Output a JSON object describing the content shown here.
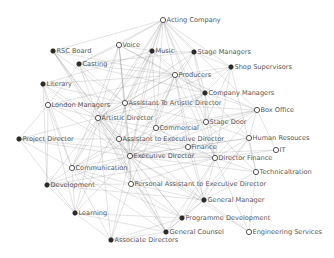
{
  "diagram": {
    "type": "network-graph",
    "nodes": [
      {
        "id": "acting-company",
        "label": "Acting Company",
        "x": 163,
        "y": 20,
        "style": "hollow"
      },
      {
        "id": "voice",
        "label": "Voice",
        "x": 119,
        "y": 45,
        "style": "hollow"
      },
      {
        "id": "music",
        "label": "Music",
        "x": 152,
        "y": 51,
        "style": "filled"
      },
      {
        "id": "stage-managers",
        "label": "Stage Managers",
        "x": 194,
        "y": 52,
        "style": "filled"
      },
      {
        "id": "rsc-board",
        "label": "RSC Board",
        "x": 53,
        "y": 51,
        "style": "filled"
      },
      {
        "id": "casting",
        "label": "Casting",
        "x": 79,
        "y": 64,
        "style": "filled"
      },
      {
        "id": "shop-supervisors",
        "label": "Shop Supervisors",
        "x": 231,
        "y": 67,
        "style": "filled"
      },
      {
        "id": "producers",
        "label": "Producers",
        "x": 175,
        "y": 75,
        "style": "hollow"
      },
      {
        "id": "literary",
        "label": "Literary",
        "x": 43,
        "y": 84,
        "style": "filled"
      },
      {
        "id": "company-managers",
        "label": "Company Managers",
        "x": 205,
        "y": 93,
        "style": "filled"
      },
      {
        "id": "london-managers",
        "label": "London Managers",
        "x": 48,
        "y": 105,
        "style": "hollow"
      },
      {
        "id": "assistant-to-artistic-director",
        "label": "Assistant To Artistic Director",
        "x": 125,
        "y": 103,
        "style": "hollow"
      },
      {
        "id": "box-office",
        "label": "Box Office",
        "x": 257,
        "y": 110,
        "style": "hollow"
      },
      {
        "id": "artistic-director",
        "label": "Artistic Director",
        "x": 98,
        "y": 118,
        "style": "hollow"
      },
      {
        "id": "commercial",
        "label": "Commercial",
        "x": 156,
        "y": 128,
        "style": "hollow"
      },
      {
        "id": "stage-door",
        "label": "Stage Door",
        "x": 206,
        "y": 122,
        "style": "hollow"
      },
      {
        "id": "project-director",
        "label": "Project Director",
        "x": 19,
        "y": 139,
        "style": "filled"
      },
      {
        "id": "assistant-to-executive-director",
        "label": "Assistant to Executive Director",
        "x": 119,
        "y": 139,
        "style": "hollow"
      },
      {
        "id": "human-resouces",
        "label": "Human Resouces",
        "x": 249,
        "y": 138,
        "style": "hollow"
      },
      {
        "id": "finance",
        "label": "Finance",
        "x": 188,
        "y": 147,
        "style": "hollow"
      },
      {
        "id": "it",
        "label": "IT",
        "x": 276,
        "y": 150,
        "style": "hollow"
      },
      {
        "id": "executive-director",
        "label": "Executive Director",
        "x": 130,
        "y": 156,
        "style": "hollow"
      },
      {
        "id": "director-finance",
        "label": "Director Finance",
        "x": 215,
        "y": 158,
        "style": "hollow"
      },
      {
        "id": "communication",
        "label": "Communication",
        "x": 72,
        "y": 168,
        "style": "hollow"
      },
      {
        "id": "technicaltration",
        "label": "Technicaltration",
        "x": 256,
        "y": 172,
        "style": "hollow"
      },
      {
        "id": "development",
        "label": "Development",
        "x": 47,
        "y": 185,
        "style": "filled"
      },
      {
        "id": "personal-assistant-to-executive-director",
        "label": "Personal Assistant to Executive Director",
        "x": 131,
        "y": 184,
        "style": "hollow"
      },
      {
        "id": "general-manager",
        "label": "General Manager",
        "x": 204,
        "y": 200,
        "style": "filled"
      },
      {
        "id": "learning",
        "label": "Learning",
        "x": 75,
        "y": 213,
        "style": "filled"
      },
      {
        "id": "programme-development",
        "label": "Programme Development",
        "x": 182,
        "y": 218,
        "style": "filled"
      },
      {
        "id": "general-counsel",
        "label": "General Counsel",
        "x": 166,
        "y": 232,
        "style": "filled"
      },
      {
        "id": "engineering-services",
        "label": "Engineering Services",
        "x": 249,
        "y": 232,
        "style": "hollow"
      },
      {
        "id": "associate-directors",
        "label": "Associate Directors",
        "x": 111,
        "y": 240,
        "style": "filled"
      }
    ],
    "edges": [
      [
        "acting-company",
        "voice"
      ],
      [
        "acting-company",
        "music"
      ],
      [
        "acting-company",
        "stage-managers"
      ],
      [
        "acting-company",
        "producers"
      ],
      [
        "acting-company",
        "company-managers"
      ],
      [
        "acting-company",
        "artistic-director"
      ],
      [
        "acting-company",
        "assistant-to-artistic-director"
      ],
      [
        "acting-company",
        "commercial"
      ],
      [
        "acting-company",
        "stage-door"
      ],
      [
        "acting-company",
        "box-office"
      ],
      [
        "acting-company",
        "executive-director"
      ],
      [
        "acting-company",
        "rsc-board"
      ],
      [
        "acting-company",
        "casting"
      ],
      [
        "acting-company",
        "shop-supervisors"
      ],
      [
        "acting-company",
        "assistant-to-executive-director"
      ],
      [
        "acting-company",
        "communication"
      ],
      [
        "acting-company",
        "director-finance"
      ],
      [
        "voice",
        "music"
      ],
      [
        "voice",
        "artistic-director"
      ],
      [
        "voice",
        "assistant-to-artistic-director"
      ],
      [
        "voice",
        "producers"
      ],
      [
        "voice",
        "executive-director"
      ],
      [
        "voice",
        "casting"
      ],
      [
        "voice",
        "communication"
      ],
      [
        "voice",
        "personal-assistant-to-executive-director"
      ],
      [
        "voice",
        "company-managers"
      ],
      [
        "music",
        "stage-managers"
      ],
      [
        "music",
        "producers"
      ],
      [
        "music",
        "artistic-director"
      ],
      [
        "music",
        "assistant-to-artistic-director"
      ],
      [
        "music",
        "executive-director"
      ],
      [
        "music",
        "company-managers"
      ],
      [
        "music",
        "commercial"
      ],
      [
        "music",
        "literary"
      ],
      [
        "music",
        "learning"
      ],
      [
        "stage-managers",
        "producers"
      ],
      [
        "stage-managers",
        "company-managers"
      ],
      [
        "stage-managers",
        "stage-door"
      ],
      [
        "stage-managers",
        "shop-supervisors"
      ],
      [
        "stage-managers",
        "artistic-director"
      ],
      [
        "stage-managers",
        "executive-director"
      ],
      [
        "stage-managers",
        "casting"
      ],
      [
        "rsc-board",
        "artistic-director"
      ],
      [
        "rsc-board",
        "executive-director"
      ],
      [
        "rsc-board",
        "assistant-to-artistic-director"
      ],
      [
        "rsc-board",
        "producers"
      ],
      [
        "rsc-board",
        "assistant-to-executive-director"
      ],
      [
        "rsc-board",
        "general-counsel"
      ],
      [
        "casting",
        "artistic-director"
      ],
      [
        "casting",
        "assistant-to-artistic-director"
      ],
      [
        "casting",
        "producers"
      ],
      [
        "casting",
        "executive-director"
      ],
      [
        "casting",
        "london-managers"
      ],
      [
        "casting",
        "company-managers"
      ],
      [
        "shop-supervisors",
        "producers"
      ],
      [
        "shop-supervisors",
        "company-managers"
      ],
      [
        "shop-supervisors",
        "technicaltration"
      ],
      [
        "shop-supervisors",
        "stage-door"
      ],
      [
        "shop-supervisors",
        "artistic-director"
      ],
      [
        "shop-supervisors",
        "director-finance"
      ],
      [
        "producers",
        "company-managers"
      ],
      [
        "producers",
        "artistic-director"
      ],
      [
        "producers",
        "assistant-to-artistic-director"
      ],
      [
        "producers",
        "executive-director"
      ],
      [
        "producers",
        "commercial"
      ],
      [
        "producers",
        "box-office"
      ],
      [
        "producers",
        "literary"
      ],
      [
        "producers",
        "london-managers"
      ],
      [
        "producers",
        "finance"
      ],
      [
        "producers",
        "general-manager"
      ],
      [
        "producers",
        "director-finance"
      ],
      [
        "producers",
        "personal-assistant-to-executive-director"
      ],
      [
        "literary",
        "artistic-director"
      ],
      [
        "literary",
        "assistant-to-artistic-director"
      ],
      [
        "literary",
        "london-managers"
      ],
      [
        "literary",
        "executive-director"
      ],
      [
        "literary",
        "development"
      ],
      [
        "literary",
        "communication"
      ],
      [
        "company-managers",
        "stage-door"
      ],
      [
        "company-managers",
        "box-office"
      ],
      [
        "company-managers",
        "executive-director"
      ],
      [
        "company-managers",
        "artistic-director"
      ],
      [
        "company-managers",
        "commercial"
      ],
      [
        "company-managers",
        "director-finance"
      ],
      [
        "company-managers",
        "human-resouces"
      ],
      [
        "company-managers",
        "assistant-to-executive-director"
      ],
      [
        "london-managers",
        "artistic-director"
      ],
      [
        "london-managers",
        "executive-director"
      ],
      [
        "london-managers",
        "communication"
      ],
      [
        "london-managers",
        "development"
      ],
      [
        "london-managers",
        "learning"
      ],
      [
        "london-managers",
        "assistant-to-artistic-director"
      ],
      [
        "london-managers",
        "project-director"
      ],
      [
        "assistant-to-artistic-director",
        "artistic-director"
      ],
      [
        "assistant-to-artistic-director",
        "executive-director"
      ],
      [
        "assistant-to-artistic-director",
        "commercial"
      ],
      [
        "assistant-to-artistic-director",
        "stage-door"
      ],
      [
        "assistant-to-artistic-director",
        "assistant-to-executive-director"
      ],
      [
        "assistant-to-artistic-director",
        "box-office"
      ],
      [
        "box-office",
        "stage-door"
      ],
      [
        "box-office",
        "commercial"
      ],
      [
        "box-office",
        "director-finance"
      ],
      [
        "box-office",
        "human-resouces"
      ],
      [
        "box-office",
        "finance"
      ],
      [
        "box-office",
        "executive-director"
      ],
      [
        "box-office",
        "it"
      ],
      [
        "artistic-director",
        "executive-director"
      ],
      [
        "artistic-director",
        "assistant-to-executive-director"
      ],
      [
        "artistic-director",
        "communication"
      ],
      [
        "artistic-director",
        "development"
      ],
      [
        "artistic-director",
        "commercial"
      ],
      [
        "artistic-director",
        "project-director"
      ],
      [
        "artistic-director",
        "associate-directors"
      ],
      [
        "artistic-director",
        "learning"
      ],
      [
        "artistic-director",
        "general-counsel"
      ],
      [
        "artistic-director",
        "programme-development"
      ],
      [
        "artistic-director",
        "general-manager"
      ],
      [
        "artistic-director",
        "personal-assistant-to-executive-director"
      ],
      [
        "artistic-director",
        "finance"
      ],
      [
        "commercial",
        "executive-director"
      ],
      [
        "commercial",
        "finance"
      ],
      [
        "commercial",
        "director-finance"
      ],
      [
        "commercial",
        "stage-door"
      ],
      [
        "commercial",
        "communication"
      ],
      [
        "commercial",
        "general-manager"
      ],
      [
        "stage-door",
        "executive-director"
      ],
      [
        "stage-door",
        "director-finance"
      ],
      [
        "stage-door",
        "human-resouces"
      ],
      [
        "stage-door",
        "technicaltration"
      ],
      [
        "project-director",
        "executive-director"
      ],
      [
        "project-director",
        "assistant-to-executive-director"
      ],
      [
        "project-director",
        "communication"
      ],
      [
        "project-director",
        "director-finance"
      ],
      [
        "project-director",
        "learning"
      ],
      [
        "assistant-to-executive-director",
        "executive-director"
      ],
      [
        "assistant-to-executive-director",
        "director-finance"
      ],
      [
        "assistant-to-executive-director",
        "finance"
      ],
      [
        "assistant-to-executive-director",
        "communication"
      ],
      [
        "assistant-to-executive-director",
        "personal-assistant-to-executive-director"
      ],
      [
        "human-resouces",
        "director-finance"
      ],
      [
        "human-resouces",
        "executive-director"
      ],
      [
        "human-resouces",
        "technicaltration"
      ],
      [
        "human-resouces",
        "finance"
      ],
      [
        "human-resouces",
        "general-manager"
      ],
      [
        "human-resouces",
        "programme-development"
      ],
      [
        "finance",
        "director-finance"
      ],
      [
        "finance",
        "executive-director"
      ],
      [
        "finance",
        "general-manager"
      ],
      [
        "it",
        "director-finance"
      ],
      [
        "it",
        "executive-director"
      ],
      [
        "executive-director",
        "director-finance"
      ],
      [
        "executive-director",
        "communication"
      ],
      [
        "executive-director",
        "development"
      ],
      [
        "executive-director",
        "personal-assistant-to-executive-director"
      ],
      [
        "executive-director",
        "general-manager"
      ],
      [
        "executive-director",
        "general-counsel"
      ],
      [
        "executive-director",
        "programme-development"
      ],
      [
        "executive-director",
        "learning"
      ],
      [
        "executive-director",
        "technicaltration"
      ],
      [
        "executive-director",
        "associate-directors"
      ],
      [
        "executive-director",
        "engineering-services"
      ],
      [
        "director-finance",
        "technicaltration"
      ],
      [
        "director-finance",
        "general-manager"
      ],
      [
        "director-finance",
        "programme-development"
      ],
      [
        "director-finance",
        "general-counsel"
      ],
      [
        "director-finance",
        "engineering-services"
      ],
      [
        "director-finance",
        "personal-assistant-to-executive-director"
      ],
      [
        "director-finance",
        "development"
      ],
      [
        "communication",
        "development"
      ],
      [
        "communication",
        "learning"
      ],
      [
        "communication",
        "personal-assistant-to-executive-director"
      ],
      [
        "communication",
        "associate-directors"
      ],
      [
        "communication",
        "general-counsel"
      ],
      [
        "communication",
        "programme-development"
      ],
      [
        "technicaltration",
        "general-manager"
      ],
      [
        "technicaltration",
        "engineering-services"
      ],
      [
        "development",
        "learning"
      ],
      [
        "development",
        "personal-assistant-to-executive-director"
      ],
      [
        "development",
        "general-manager"
      ],
      [
        "personal-assistant-to-executive-director",
        "general-manager"
      ],
      [
        "personal-assistant-to-executive-director",
        "programme-development"
      ],
      [
        "personal-assistant-to-executive-director",
        "general-counsel"
      ],
      [
        "personal-assistant-to-executive-director",
        "associate-directors"
      ],
      [
        "general-manager",
        "programme-development"
      ],
      [
        "general-manager",
        "general-counsel"
      ],
      [
        "general-manager",
        "engineering-services"
      ],
      [
        "learning",
        "associate-directors"
      ],
      [
        "learning",
        "programme-development"
      ],
      [
        "learning",
        "general-counsel"
      ],
      [
        "programme-development",
        "general-counsel"
      ],
      [
        "programme-development",
        "associate-directors"
      ],
      [
        "general-counsel",
        "associate-directors"
      ]
    ]
  }
}
